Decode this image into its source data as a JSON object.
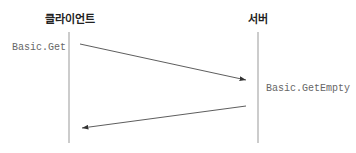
{
  "participants": {
    "client": {
      "label": "클라이언트"
    },
    "server": {
      "label": "서버"
    }
  },
  "messages": [
    {
      "label": "Basic.Get",
      "from": "client",
      "to": "server"
    },
    {
      "label": "Basic.GetEmpty",
      "from": "server",
      "to": "client"
    }
  ],
  "colors": {
    "lifeline": "#999999",
    "arrow": "#333333",
    "label": "#666666"
  }
}
